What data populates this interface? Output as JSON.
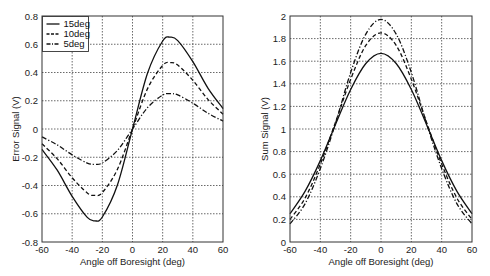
{
  "chart_data": [
    {
      "type": "line",
      "title": "",
      "xlabel": "Angle off Boresight (deg)",
      "ylabel": "Error Signal (V)",
      "xlim": [
        -60,
        60
      ],
      "ylim": [
        -0.8,
        0.8
      ],
      "xticks": [
        "-60",
        "-40",
        "-20",
        "0",
        "20",
        "40",
        "60"
      ],
      "yticks": [
        "0.8",
        "0.6",
        "0.4",
        "0.2",
        "0",
        "-0.2",
        "-0.4",
        "-0.6",
        "-0.8"
      ],
      "grid": true,
      "legend_position": "upper left",
      "x": [
        -60,
        -50,
        -40,
        -30,
        -25,
        -20,
        -10,
        0,
        10,
        20,
        25,
        30,
        40,
        50,
        60
      ],
      "series": [
        {
          "name": "15deg",
          "style": "solid",
          "values": [
            -0.145,
            -0.29,
            -0.477,
            -0.626,
            -0.65,
            -0.623,
            -0.396,
            0,
            0.396,
            0.623,
            0.65,
            0.626,
            0.477,
            0.29,
            0.145
          ]
        },
        {
          "name": "10deg",
          "style": "dashed",
          "values": [
            -0.105,
            -0.21,
            -0.345,
            -0.453,
            -0.47,
            -0.45,
            -0.286,
            0,
            0.286,
            0.45,
            0.47,
            0.453,
            0.345,
            0.21,
            0.105
          ]
        },
        {
          "name": "5deg",
          "style": "dashdot",
          "values": [
            -0.056,
            -0.112,
            -0.183,
            -0.241,
            -0.25,
            -0.24,
            -0.152,
            0,
            0.152,
            0.24,
            0.25,
            0.241,
            0.183,
            0.112,
            0.056
          ]
        }
      ]
    },
    {
      "type": "line",
      "title": "",
      "xlabel": "Angle off Boresight (deg)",
      "ylabel": "Sum Signal (V)",
      "xlim": [
        -60,
        60
      ],
      "ylim": [
        0,
        2
      ],
      "xticks": [
        "-60",
        "-40",
        "-20",
        "0",
        "20",
        "40",
        "60"
      ],
      "yticks": [
        "2",
        "1.8",
        "1.6",
        "1.4",
        "1.2",
        "1",
        "0.8",
        "0.6",
        "0.4",
        "0.2",
        "0"
      ],
      "grid": true,
      "x": [
        -60,
        -50,
        -40,
        -30,
        -20,
        -10,
        0,
        10,
        20,
        30,
        40,
        50,
        60
      ],
      "series": [
        {
          "name": "15deg",
          "style": "solid",
          "values": [
            0.25,
            0.45,
            0.72,
            1.04,
            1.35,
            1.58,
            1.67,
            1.58,
            1.35,
            1.04,
            0.72,
            0.45,
            0.25
          ]
        },
        {
          "name": "10deg",
          "style": "dashed",
          "values": [
            0.2,
            0.39,
            0.69,
            1.06,
            1.44,
            1.74,
            1.85,
            1.74,
            1.44,
            1.06,
            0.69,
            0.39,
            0.2
          ]
        },
        {
          "name": "5deg",
          "style": "dashdot",
          "values": [
            0.16,
            0.34,
            0.65,
            1.05,
            1.5,
            1.84,
            1.97,
            1.84,
            1.5,
            1.05,
            0.65,
            0.34,
            0.16
          ]
        }
      ]
    }
  ],
  "legend": {
    "items": [
      "15deg",
      "10deg",
      "5deg"
    ]
  }
}
